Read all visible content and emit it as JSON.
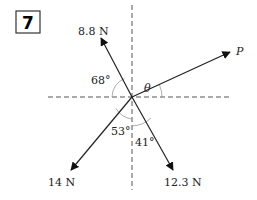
{
  "problem_number": "7",
  "forces": [
    {
      "id": "f1",
      "label": "8.8 N",
      "angle_label": "68°",
      "angle_ref": "negative x-axis"
    },
    {
      "id": "f2",
      "label": "14 N",
      "angle_label": "53°",
      "angle_ref": "negative y-axis"
    },
    {
      "id": "f3",
      "label": "12.3 N",
      "angle_label": "41°",
      "angle_ref": "negative y-axis"
    },
    {
      "id": "p",
      "label": "P",
      "angle_label": "θ",
      "angle_ref": "positive x-axis"
    }
  ],
  "colors": {
    "line": "#222222",
    "axis": "#555555",
    "arc": "#999999"
  }
}
